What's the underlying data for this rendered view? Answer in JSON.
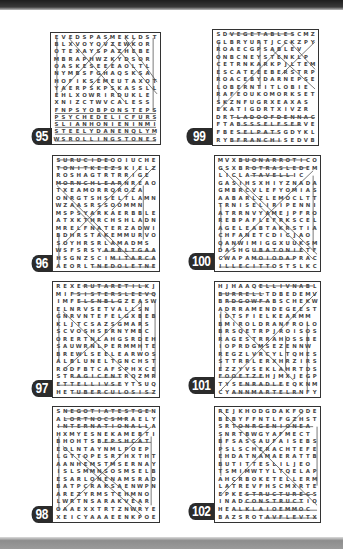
{
  "page": {
    "top_bar_color": "#2a2a2a",
    "bottom_bar_color": "#999999",
    "label_color": "#2b2b2b"
  },
  "puzzles": [
    {
      "number": "95",
      "rows": [
        "EVEDSPASMEKLDST",
        "BLXVOYQVZEWKOR",
        "OTEXAYSPAZHEBE",
        "MBRAPHWZKYDSOR",
        "OASKESEEEAOLTL",
        "NYMBSFGHAQSKSA",
        "HOFIKSEMEUTAXOT",
        "YAERPSKPSKASSLL",
        "EHLXOWRIRDUKLE",
        "XNIZCTWVCALESS",
        "FNPSYOBPONSTEPS",
        "PSYCHEDELICFURS",
        "SLIANHONIENINMI",
        "STEELYDANENQLYM",
        "WSROLLINGSTONES"
      ]
    },
    {
      "number": "96",
      "rows": [
        "SURUCIDEOOIUCHEZ",
        "TONITKEEZSKIELZM",
        "ROSHAGTRTRRIGE",
        "MORNCHLEARNREAOS",
        "TXEAMORRQROZA",
        "ONRGTSHSELTLAMNT",
        "WZAASRSSOOMMN",
        "MSPSYARKAERBBLE",
        "ATXKTHRCHSHLADN",
        "MRELFNATERZADWI",
        "BDHRSTAKEMMURVO",
        "SOYHRSRLAMADMS",
        "WSFSRSYARBLTGAAT",
        "HSGNZSCIMITARCAT",
        "AEORLTNEDOLETNE"
      ]
    },
    {
      "number": "97",
      "rows": [
        "REXERUTARETILKJ",
        "MIFSISTERSLEEVQN",
        "IMFELSNBLGZEASW",
        "ELNRVSETVALLSN",
        "GNRVNTEFELGXBEB",
        "KLJTCSAZSGMARS",
        "SCVOSHSERNYMBC",
        "ORERTNLAHGSRDEH",
        "SAUWRNLPERMMHTE",
        "BREWLSEELEARWOS",
        "ALBLUNELTGNCHST",
        "RODFBTCAFSPHXCE",
        "STRAGICENTRQZMR",
        "ETTELLIVSEYTSUQ",
        "HETUBERCULOSISZ"
      ]
    },
    {
      "number": "98",
      "rows": [
        "SNEGOTIATESTGEN",
        "ALORTNOCSMRAELY",
        "INTERNATIONALLA",
        "HXMYESNEKAMEBTI",
        "BHOHTSBEPSHCAT",
        "EOLNTAYNMLPOEP",
        "LGTTOPESRTHXTHT",
        "AANHEMSTMSERNAY",
        "ISLSMMNSOSMSELB",
        "ESARLONENAMSRADT",
        "BATPCRAKSAENWPN",
        "AREZYRMSTEHMNO",
        "LWRTNSARAKVEAR",
        "OAAEXXTRTZNWRYE",
        "XEICYAAAEENKPOE"
      ]
    },
    {
      "number": "99",
      "rows": [
        "SDVEGETABLESCMZ",
        "GLBRYURTJCCKZPY",
        "ROAECGPSABLEV",
        "ONBCNEYSTENKLP",
        "CETRNKARKPJLTEM",
        "ESCATEEEBERSTRP",
        "ROACEBYDARNEPSE",
        "LOBERNTITLOBIE",
        "RAFEOUKOMORKSET",
        "SKZNFUGRXEAXAS",
        "EKATIGDRTXIVZR",
        "DRTLADOOFDENNAC",
        "FTABSSSELFSERVEO",
        "FBESELPATSGDYKL",
        "RYBFRANCHISEDVB"
      ]
    },
    {
      "number": "100",
      "rows": [
        "MVXBUONARROTICO",
        "GSXBROTRASLEDEM",
        "LICLATAVELLIC",
        "GASIHSXHIYZNADA",
        "GMBRCVLEFYOMIAS",
        "AABARLZLEMOCLTT",
        "TRNISELIRIPENNI",
        "ATRRNVYAMEJPFRO",
        "REBPAFLEFRKSCEL",
        "AGELEABTAKRSTIA",
        "CHFANETCDICJAO",
        "QANWIMIGGXUUKSM",
        "DASHGUBATONIETF",
        "CWAPAMOIODAPRAC",
        "ILLECITTOSTSLKC"
      ]
    },
    {
      "number": "101",
      "rows": [
        "HJHAAQELLIVNABL",
        "BURRELLTDBEDEMV",
        "BRDGOWFABSCHEKW",
        "ADRRAMENDEGEEST",
        "IDTSFIELKEARMM",
        "BMIROLDRANFROLOT",
        "BRSQETRPJROISOS",
        "RAGESTRRAHOSSBEG",
        "IOPRDGMSEZENNW",
        "REGZLVRCYLTQHES",
        "STTRRLERXHRZIRS",
        "EZZYVSEKLAHRTDS",
        "FOOETZEHJMXJEGP",
        "TYSENRADLEEQKNM",
        "CYANNMARTELRNFY"
      ]
    },
    {
      "number": "102",
      "rows": [
        "REJKHODGDAKFQDE",
        "BEBYFFNTLFGZHST",
        "SRTONRGENIONEA",
        "SNRTBWGYAFMECT",
        "BFSASSAUFAISEBS",
        "PSLSCHERACHTEFE",
        "EHDATNAMAERATTB",
        "BUTITTESLILJEO",
        "TSMIMWTYLTQELAP",
        "AHCRBOKETELLERM",
        "LATREVFHSCMXRTE",
        "EPKESTRUCTURECS",
        "INADCONSTRUCTION",
        "HEALKLAIOEMMOC",
        "BAZSROTAVFLEVTX"
      ]
    }
  ]
}
